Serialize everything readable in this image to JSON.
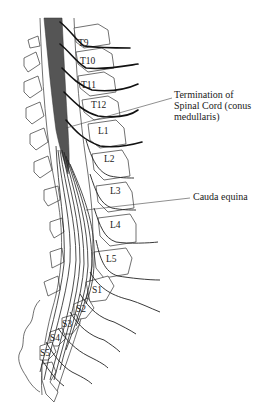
{
  "figure": {
    "colors": {
      "cord": "#555555",
      "line": "#222222",
      "background": "#ffffff"
    }
  },
  "vertebrae": {
    "thoracic": [
      "T9",
      "T10",
      "T11",
      "T12"
    ],
    "lumbar": [
      "L1",
      "L2",
      "L3",
      "L4",
      "L5"
    ],
    "sacral": [
      "S1",
      "S2",
      "S3",
      "S4",
      "S5"
    ]
  },
  "labels": {
    "T9": "T9",
    "T10": "T10",
    "T11": "T11",
    "T12": "T12",
    "L1": "L1",
    "L2": "L2",
    "L3": "L3",
    "L4": "L4",
    "L5": "L5",
    "S1": "S1",
    "S2": "S2",
    "S3": "S3",
    "S4": "S4",
    "S5": "S5"
  },
  "callouts": {
    "conus": {
      "line1": "Termination of",
      "line2": "Spinal Cord (conus",
      "line3": "medullaris)"
    },
    "cauda": {
      "text": "Cauda equina"
    }
  }
}
